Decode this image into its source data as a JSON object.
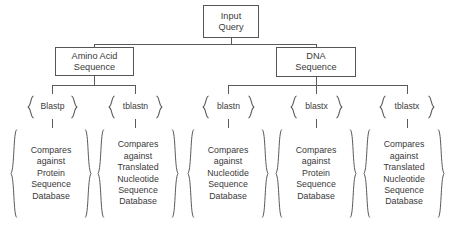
{
  "diagram": {
    "root": {
      "lines": [
        "Input",
        "Query"
      ]
    },
    "branches": [
      {
        "key": "amino",
        "lines": [
          "Amino Acid",
          "Sequence"
        ]
      },
      {
        "key": "dna",
        "lines": [
          "DNA",
          "Sequence"
        ]
      }
    ],
    "programs": [
      {
        "name": "Blastp",
        "parent": "amino"
      },
      {
        "name": "tblastn",
        "parent": "amino"
      },
      {
        "name": "blastn",
        "parent": "dna"
      },
      {
        "name": "blastx",
        "parent": "dna"
      },
      {
        "name": "tblastx",
        "parent": "dna"
      }
    ],
    "descriptions": [
      {
        "for": "Blastp",
        "lines": [
          "Compares",
          "against",
          "Protein",
          "Sequence",
          "Database"
        ]
      },
      {
        "for": "tblastn",
        "lines": [
          "Compares",
          "against",
          "Translated",
          "Nucleotide",
          "Sequence",
          "Database"
        ]
      },
      {
        "for": "blastn",
        "lines": [
          "Compares",
          "against",
          "Nucleotide",
          "Sequence",
          "Database"
        ]
      },
      {
        "for": "blastx",
        "lines": [
          "Compares",
          "against",
          "Protein",
          "Sequence",
          "Database"
        ]
      },
      {
        "for": "tblastx",
        "lines": [
          "Compares",
          "against",
          "Translated",
          "Nucleotide",
          "Sequence",
          "Database"
        ]
      }
    ],
    "style": {
      "background": "#ffffff",
      "text_color": "#3a3a3a",
      "line_color": "#5a5a5a",
      "box_border": "#555555"
    }
  }
}
